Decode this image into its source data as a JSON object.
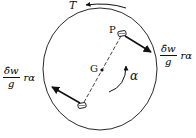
{
  "diagram": {
    "labels": {
      "torque": "T",
      "point_p": "P",
      "center_g": "G",
      "angular_accel": "α"
    },
    "force_right": {
      "numerator": "δ̂w",
      "denominator": "g",
      "tail": "rα"
    },
    "force_left": {
      "numerator": "δ̂w",
      "denominator": "g",
      "tail": "rα"
    },
    "colors": {
      "stroke": "#111111",
      "background": "#ffffff"
    }
  }
}
